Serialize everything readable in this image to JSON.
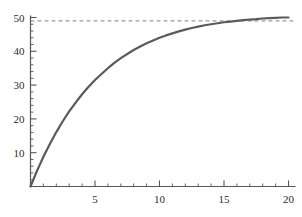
{
  "chart_data": {
    "type": "line",
    "title": "",
    "subtitle": "",
    "xlabel": "",
    "ylabel": "",
    "xlim": [
      0,
      20.8
    ],
    "ylim": [
      0,
      51
    ],
    "grid": false,
    "legend": null,
    "background_color": "#ffffff",
    "xticks": [
      5,
      10,
      15,
      20
    ],
    "xtick_labels": [
      "5",
      "10",
      "15",
      "20"
    ],
    "xminor_step": 1,
    "yticks": [
      10,
      20,
      30,
      40,
      50
    ],
    "ytick_labels": [
      "10",
      "20",
      "30",
      "40",
      "50"
    ],
    "yminor_step": 2,
    "axis_color": "#555555",
    "series": [
      {
        "name": "curve",
        "type": "line",
        "color": "#5a5a5a",
        "linewidth": 2.2,
        "linestyle": "solid",
        "x": [
          0,
          0.25,
          0.5,
          0.75,
          1,
          1.5,
          2,
          2.5,
          3,
          3.5,
          4,
          4.5,
          5,
          5.5,
          6,
          6.5,
          7,
          7.5,
          8,
          8.5,
          9,
          9.5,
          10,
          10.5,
          11,
          11.5,
          12,
          12.5,
          13,
          13.5,
          14,
          14.5,
          15,
          15.5,
          16,
          16.5,
          17,
          17.5,
          18,
          18.5,
          19,
          19.5,
          20
        ],
        "y": [
          0,
          2.3,
          4.6,
          6.7,
          8.8,
          12.6,
          16.1,
          19.3,
          22.2,
          24.8,
          27.3,
          29.5,
          31.5,
          33.3,
          35.0,
          36.6,
          38.0,
          39.2,
          40.4,
          41.4,
          42.4,
          43.2,
          44.0,
          44.7,
          45.3,
          45.9,
          46.4,
          46.9,
          47.3,
          47.7,
          48.0,
          48.3,
          48.6,
          48.8,
          49.0,
          49.2,
          49.4,
          49.5,
          49.7,
          49.8,
          49.9,
          50.0,
          50.0
        ]
      }
    ],
    "annotations": [
      {
        "name": "asymptote",
        "type": "hline",
        "value": 49,
        "label": "",
        "color": "#9a9a9a",
        "linestyle": "dashed",
        "x_start": 0,
        "x_end": 20.6
      }
    ]
  }
}
